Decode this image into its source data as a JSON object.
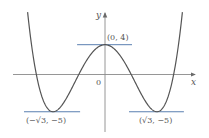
{
  "chart_data": {
    "type": "line",
    "title": "",
    "function": "y = x^4 - 6x^2 + 4",
    "xlabel": "x",
    "ylabel": "y",
    "origin_label": "0",
    "grid": false,
    "xlim": [
      -2.9,
      2.97
    ],
    "ylim": [
      -7.8,
      10
    ],
    "critical_points": [
      {
        "x": -1.732,
        "y": -5,
        "label": "(−√3, −5)",
        "kind": "local minimum"
      },
      {
        "x": 0,
        "y": 4,
        "label": "(0, 4)",
        "kind": "local maximum"
      },
      {
        "x": 1.732,
        "y": -5,
        "label": "(√3, −5)",
        "kind": "local minimum"
      }
    ],
    "tangent_lines": [
      {
        "y": 4,
        "x_from": -0.93,
        "x_to": 0.9
      },
      {
        "y": -5,
        "x_from": -2.7,
        "x_to": -0.83
      },
      {
        "y": -5,
        "x_from": 0.8,
        "x_to": 2.63
      }
    ],
    "colors": {
      "curve": "#555555",
      "axes": "#8a8a8a",
      "tangent": "#5a7fb0",
      "labels": "#555555"
    }
  },
  "labels": {
    "y_axis": "y",
    "x_axis": "x",
    "origin": "0",
    "max_point": "(0, 4)",
    "min_left": "(−√3, −5)",
    "min_right": "(√3, −5)"
  }
}
